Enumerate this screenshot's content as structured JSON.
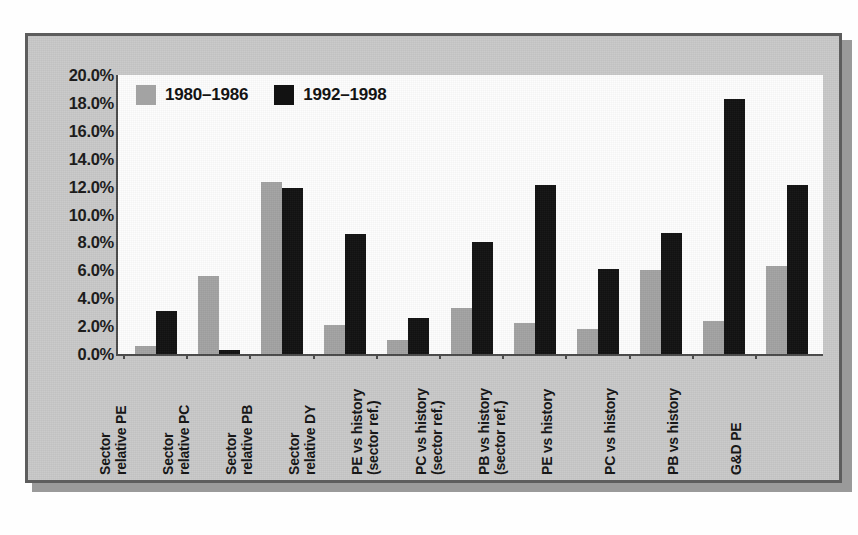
{
  "chart_data": {
    "type": "bar",
    "title": "",
    "subtitle": "",
    "xlabel": "",
    "ylabel": "",
    "ylim": [
      0,
      20
    ],
    "ytick_labels": [
      "20.0%",
      "18.0%",
      "16.0%",
      "14.0%",
      "12.0%",
      "10.0%",
      "8.0%",
      "6.0%",
      "4.0%",
      "2.0%",
      "0.0%"
    ],
    "ytick_values": [
      20,
      18,
      16,
      14,
      12,
      10,
      8,
      6,
      4,
      2,
      0
    ],
    "grid": false,
    "legend_position": "top-left",
    "value_unit": "%",
    "categories": [
      "Sector relative PE",
      "Sector relative PC",
      "Sector relative PB",
      "Sector relative DY",
      "PE vs history (sector ref.)",
      "PC vs history (sector ref.)",
      "PB vs history (sector ref.)",
      "PE vs history",
      "PC vs history",
      "PB vs history",
      "G&D PE"
    ],
    "category_lines": [
      [
        "Sector",
        "relative PE"
      ],
      [
        "Sector",
        "relative PC"
      ],
      [
        "Sector",
        "relative PB"
      ],
      [
        "Sector",
        "relative DY"
      ],
      [
        "PE vs history",
        "(sector ref.)"
      ],
      [
        "PC vs history",
        "(sector ref.)"
      ],
      [
        "PB vs history",
        "(sector ref.)"
      ],
      [
        "PE vs history"
      ],
      [
        "PC vs history"
      ],
      [
        "PB vs history"
      ],
      [
        "G&D PE"
      ]
    ],
    "series": [
      {
        "name": "1980–1986",
        "color": "#a3a3a3",
        "values": [
          0.6,
          5.6,
          12.3,
          2.1,
          1.0,
          3.3,
          2.2,
          1.8,
          6.0,
          2.4,
          6.3
        ]
      },
      {
        "name": "1992–1998",
        "color": "#121212",
        "values": [
          3.1,
          0.3,
          11.9,
          8.6,
          2.6,
          8.0,
          12.1,
          6.1,
          8.7,
          18.3,
          12.1
        ]
      }
    ]
  }
}
